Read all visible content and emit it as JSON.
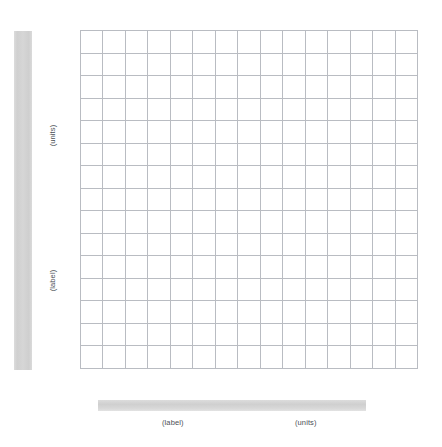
{
  "figure": {
    "type": "blank-plot-grid-template",
    "grid": {
      "columns": 15,
      "rows": 15,
      "line_color": "#b9bcc2",
      "cell_background": "#ffffff"
    },
    "placeholder_bar_color": "#d4d4d4",
    "caption_text_color": "#4b4f56"
  },
  "y_axis": {
    "bar_name": "vertical-axis-label-placeholder",
    "units_caption": "(units)",
    "label_caption": "(label)"
  },
  "x_axis": {
    "bar_name": "horizontal-axis-label-placeholder",
    "label_caption": "(label)",
    "units_caption": "(units)"
  },
  "chart_data": {
    "type": "table",
    "title": "",
    "subtitle": "",
    "xlabel": "(label)",
    "ylabel": "(label)",
    "x_units": "(units)",
    "y_units": "(units)",
    "grid": true,
    "legend": null,
    "categories": [],
    "values": [],
    "series": [],
    "annotations": []
  }
}
